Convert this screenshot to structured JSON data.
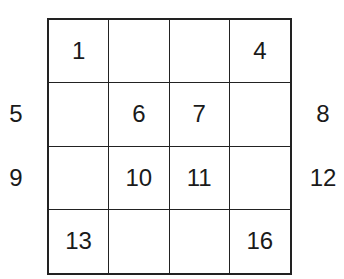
{
  "grid": {
    "rows": [
      [
        "1",
        "",
        "",
        "4"
      ],
      [
        "",
        "6",
        "7",
        ""
      ],
      [
        "",
        "10",
        "11",
        ""
      ],
      [
        "13",
        "",
        "",
        "16"
      ]
    ]
  },
  "outside_labels": {
    "left": [
      "",
      "5",
      "9",
      ""
    ],
    "right": [
      "",
      "8",
      "12",
      ""
    ]
  }
}
